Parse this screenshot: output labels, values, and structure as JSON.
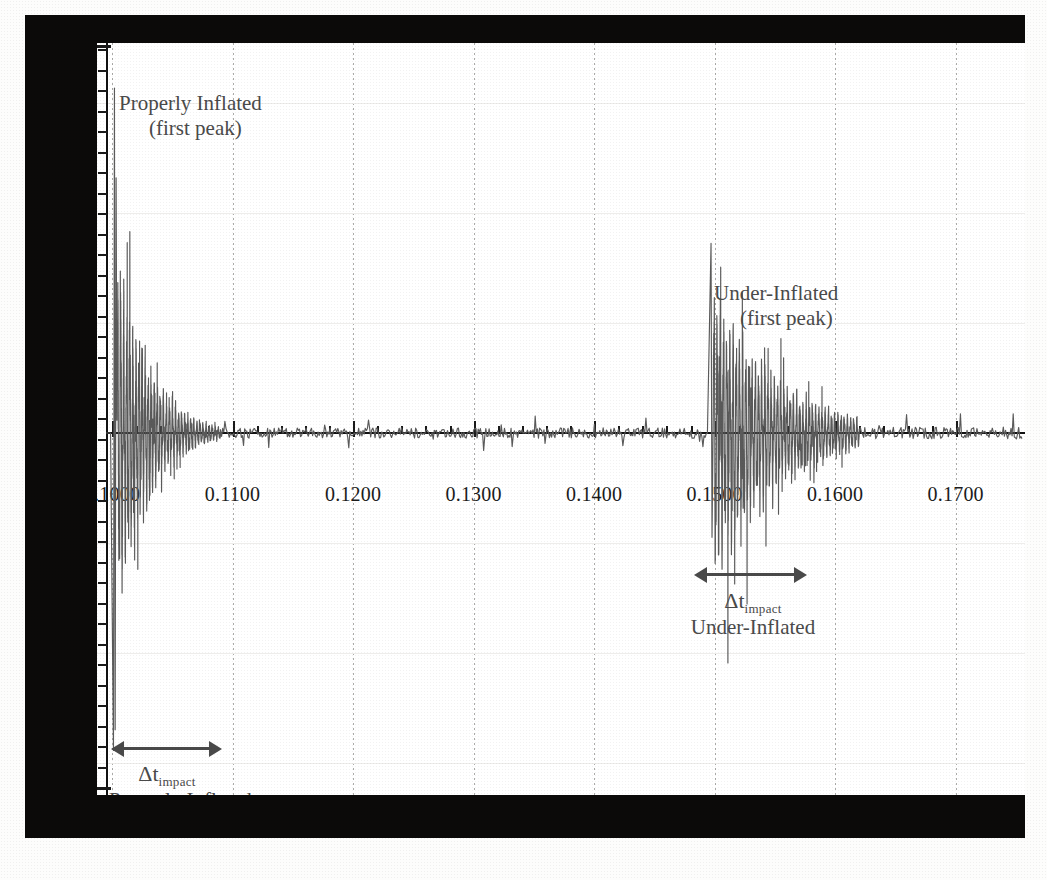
{
  "figure": {
    "kind": "scanned-waveform-figure",
    "background_color": "#fdfdfc",
    "scan_border_color": "#0b0a09",
    "trace_color": "#5a5a5a",
    "text_color": "#4a4a4a"
  },
  "annotations": {
    "properly_inflated_peak_line1": "Properly Inflated",
    "properly_inflated_peak_line2": "(first peak)",
    "under_inflated_peak_line1": "Under-Inflated",
    "under_inflated_peak_line2": "(first peak)",
    "delta_t_symbol": "Δt",
    "delta_t_subscript": "impact",
    "properly_inflated_span_label": "Properly Inflated",
    "under_inflated_span_label": "Under-Inflated"
  },
  "chart_data": {
    "type": "line",
    "title": "",
    "subtitle": "",
    "xlabel": "",
    "ylabel": "",
    "grid": true,
    "legend_position": "none",
    "xlim": [
      0.0995,
      0.1755
    ],
    "ylim": [
      -1.0,
      1.0
    ],
    "x_tick_labels": [
      "0.1000",
      "0.1100",
      "0.1200",
      "0.1300",
      "0.1400",
      "0.1500",
      "0.1600",
      "0.1700"
    ],
    "x_tick_values": [
      0.1,
      0.11,
      0.12,
      0.13,
      0.14,
      0.15,
      0.16,
      0.17
    ],
    "x_minor_tick_count_per_major": 5,
    "y_tick_labels": [],
    "y_axis_labeled": false,
    "y_minor_tick_count": 36,
    "series": [
      {
        "name": "Properly Inflated impact",
        "onset_x": 0.1,
        "first_peak_x": 0.1002,
        "decay_end_x": 0.109,
        "peak_amplitude": 1.0,
        "description": "Large first peak at impact followed by rapidly decaying oscillation"
      },
      {
        "name": "Under-Inflated impact",
        "onset_x": 0.1495,
        "first_peak_x": 0.1497,
        "decay_end_x": 0.162,
        "peak_amplitude": 0.55,
        "description": "Smaller first peak followed by longer, lower-frequency decaying oscillation"
      }
    ],
    "span_markers": [
      {
        "label": "Properly Inflated",
        "symbol": "Δt_impact",
        "x_start": 0.1,
        "x_end": 0.109,
        "y_position": -0.97
      },
      {
        "label": "Under-Inflated",
        "symbol": "Δt_impact",
        "x_start": 0.1495,
        "x_end": 0.162,
        "y_position": -0.49
      }
    ]
  }
}
